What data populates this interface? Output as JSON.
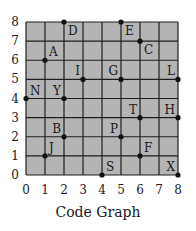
{
  "chart_data": {
    "type": "scatter",
    "title": "Code Graph",
    "xlabel": "",
    "ylabel": "",
    "xlim": [
      0,
      8
    ],
    "ylim": [
      0,
      8
    ],
    "grid": true,
    "x_ticks": [
      "0",
      "1",
      "2",
      "3",
      "4",
      "5",
      "6",
      "7",
      "8"
    ],
    "y_ticks": [
      "0",
      "1",
      "2",
      "3",
      "4",
      "5",
      "6",
      "7",
      "8"
    ],
    "points": [
      {
        "label": "D",
        "x": 2,
        "y": 8,
        "label_pos": "below-right"
      },
      {
        "label": "E",
        "x": 5,
        "y": 8,
        "label_pos": "below-right"
      },
      {
        "label": "C",
        "x": 6,
        "y": 7,
        "label_pos": "below-right"
      },
      {
        "label": "A",
        "x": 1,
        "y": 6,
        "label_pos": "above-right"
      },
      {
        "label": "I",
        "x": 3,
        "y": 5,
        "label_pos": "above-left"
      },
      {
        "label": "G",
        "x": 5,
        "y": 5,
        "label_pos": "above-left"
      },
      {
        "label": "L",
        "x": 8,
        "y": 5,
        "label_pos": "above-left"
      },
      {
        "label": "N",
        "x": 0,
        "y": 4,
        "label_pos": "above-right"
      },
      {
        "label": "Y",
        "x": 2,
        "y": 4,
        "label_pos": "above-left"
      },
      {
        "label": "T",
        "x": 6,
        "y": 3,
        "label_pos": "above-left"
      },
      {
        "label": "H",
        "x": 8,
        "y": 3,
        "label_pos": "above-left"
      },
      {
        "label": "B",
        "x": 2,
        "y": 2,
        "label_pos": "above-left"
      },
      {
        "label": "P",
        "x": 5,
        "y": 2,
        "label_pos": "above-left"
      },
      {
        "label": "J",
        "x": 1,
        "y": 1,
        "label_pos": "above-right"
      },
      {
        "label": "F",
        "x": 6,
        "y": 1,
        "label_pos": "above-right"
      },
      {
        "label": "S",
        "x": 4,
        "y": 0,
        "label_pos": "above-right"
      },
      {
        "label": "X",
        "x": 8,
        "y": 0,
        "label_pos": "above-left"
      }
    ]
  },
  "colors": {
    "plot_background": "#b4b4b4",
    "grid_line": "#1e1e1e",
    "point": "#111111",
    "text": "#1a1a1a"
  }
}
